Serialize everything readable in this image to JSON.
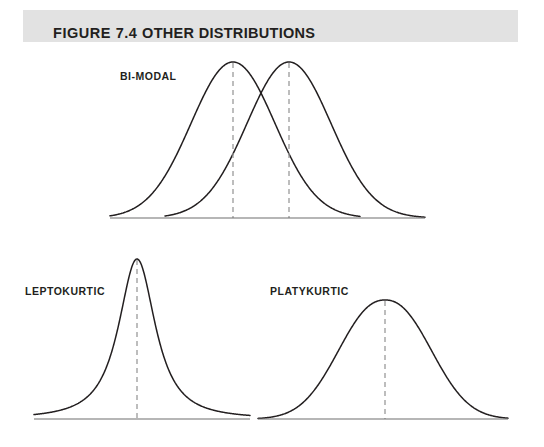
{
  "figure": {
    "banner_label_prefix": "FIGURE 7.4",
    "banner_label_title": "OTHER DISTRIBUTIONS",
    "banner_full": "FIGURE 7.4 OTHER DISTRIBUTIONS",
    "banner_bg_color": "#e2e2e2",
    "text_color": "#231f20",
    "curve_color": "#231f20",
    "axis_color": "#6e6e6e",
    "dash_color": "#9a9a9a",
    "background": "#ffffff"
  },
  "panels": [
    {
      "id": "bimodal",
      "label": "BI-MODAL"
    },
    {
      "id": "leptokurtic",
      "label": "LEPTOKURTIC"
    },
    {
      "id": "platykurtic",
      "label": "PLATYKURTIC"
    }
  ],
  "chart_data": [
    {
      "type": "line",
      "id": "bimodal",
      "title": "BI-MODAL",
      "xlabel": "",
      "ylabel": "",
      "grid": false,
      "legend": "none",
      "axis_baseline_y": 218,
      "axis_x_range": [
        110,
        425
      ],
      "annotations": [
        "dashed vertical line at each mode"
      ],
      "series": [
        {
          "name": "mode-1",
          "shape": "normal",
          "peak_x": 233,
          "peak_y": 62,
          "sigma": 42,
          "x_start": 110,
          "x_end": 360
        },
        {
          "name": "mode-2",
          "shape": "normal",
          "peak_x": 289,
          "peak_y": 62,
          "sigma": 42,
          "x_start": 165,
          "x_end": 425
        }
      ],
      "mode_lines_x": [
        233,
        289
      ]
    },
    {
      "type": "line",
      "id": "leptokurtic",
      "title": "LEPTOKURTIC",
      "xlabel": "",
      "ylabel": "",
      "grid": false,
      "legend": "none",
      "axis_baseline_y": 419,
      "axis_x_range": [
        34,
        250
      ],
      "annotations": [
        "dashed vertical line at mean"
      ],
      "series": [
        {
          "name": "leptokurtic-curve",
          "shape": "leptokurtic",
          "peak_x": 137,
          "peak_y": 259,
          "sigma": 21,
          "x_start": 34,
          "x_end": 250
        }
      ],
      "mode_lines_x": [
        137
      ]
    },
    {
      "type": "line",
      "id": "platykurtic",
      "title": "PLATYKURTIC",
      "xlabel": "",
      "ylabel": "",
      "grid": false,
      "legend": "none",
      "axis_baseline_y": 419,
      "axis_x_range": [
        258,
        508
      ],
      "annotations": [
        "dashed vertical line at mean"
      ],
      "series": [
        {
          "name": "platykurtic-curve",
          "shape": "platykurtic",
          "peak_x": 385,
          "peak_y": 300,
          "sigma": 44,
          "x_start": 258,
          "x_end": 508
        }
      ],
      "mode_lines_x": [
        385
      ]
    }
  ]
}
